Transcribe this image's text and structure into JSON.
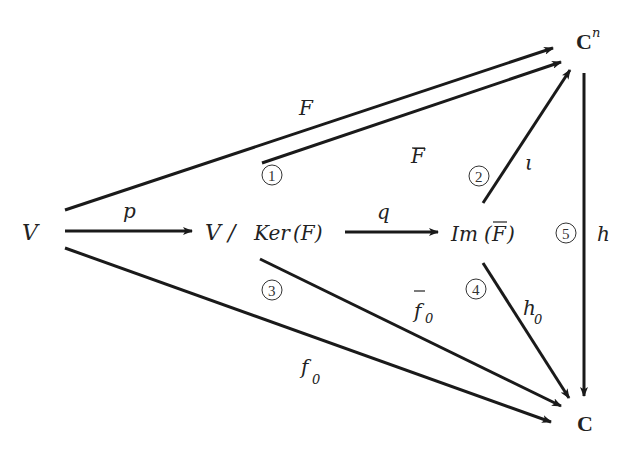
{
  "nodes": {
    "V": "V",
    "V_slash": "V /",
    "ker": "Ker",
    "ker_arg": "(F)",
    "im": "Im",
    "im_arg_open": "(",
    "im_arg_F": "F",
    "im_arg_close": ")",
    "Cn_base": "C",
    "Cn_sup": "n",
    "C": "C"
  },
  "maps": {
    "p": "p",
    "q": "q",
    "F": "F",
    "F_bar": "F",
    "iota": "ι",
    "h": "h",
    "f0_bar": "f",
    "f0_bar_sub": "0",
    "f0": "f",
    "f0_sub": "0",
    "h0": "h",
    "h0_sub": "0"
  },
  "regions": {
    "r1": "1",
    "r2": "2",
    "r3": "3",
    "r4": "4",
    "r5": "5"
  },
  "colors": {
    "ink": "#1a1a1a",
    "background": "#ffffff"
  }
}
